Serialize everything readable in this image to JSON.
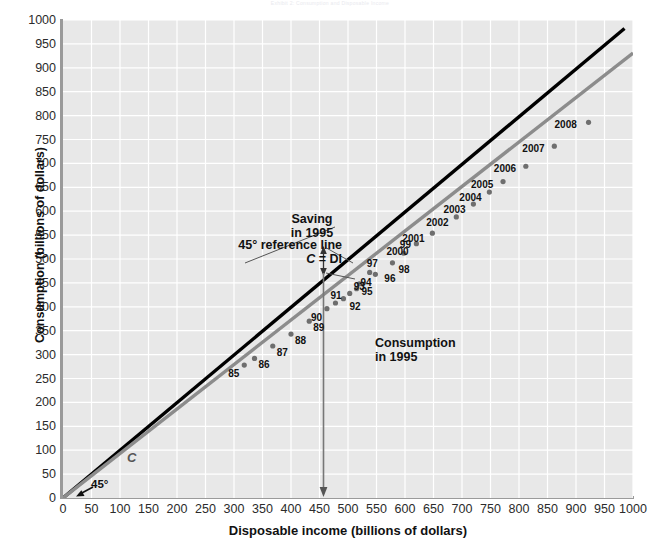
{
  "header": {
    "faint_text": "Exhibit 2: Consumption and Disposable Income"
  },
  "axes": {
    "x_title": "Disposable income (billions of dollars)",
    "y_title": "Consumption (billions of dollars)",
    "x_ticks": [
      0,
      50,
      100,
      150,
      200,
      250,
      300,
      350,
      400,
      450,
      500,
      550,
      600,
      650,
      700,
      750,
      800,
      850,
      900,
      950,
      1000
    ],
    "y_ticks": [
      0,
      50,
      100,
      150,
      200,
      250,
      300,
      350,
      400,
      450,
      500,
      550,
      600,
      650,
      700,
      750,
      800,
      850,
      900,
      950,
      1000
    ]
  },
  "annotations": {
    "ref_line_1": "45° reference line",
    "ref_line_2_c": "C",
    "ref_line_2_eq": "=",
    "ref_line_2_di": "DI",
    "saving_1": "Saving",
    "saving_2": "in 1995",
    "consumption_1": "Consumption",
    "consumption_2": "in 1995",
    "c_curve_label": "C",
    "angle_label": "45°"
  },
  "colors": {
    "plot_background": "#e8e8e8",
    "gridline": "#ffffff",
    "reference_line": "#000000",
    "consumption_line": "#8c8c8c",
    "data_point": "#6e6e6e",
    "axis": "#9a9a9a",
    "text": "#111111"
  },
  "chart_data": {
    "type": "scatter",
    "title": "Consumption and Disposable Income",
    "xlabel": "Disposable income (billions of dollars)",
    "ylabel": "Consumption (billions of dollars)",
    "xlim": [
      0,
      1000
    ],
    "ylim": [
      0,
      1000
    ],
    "grid": true,
    "legend": null,
    "point_labels": [
      "85",
      "86",
      "87",
      "88",
      "89",
      "90",
      "91",
      "92",
      "93",
      "94",
      "95",
      "96",
      "97",
      "98",
      "99",
      "2000",
      "2001",
      "2002",
      "2003",
      "2004",
      "2005",
      "2006",
      "2007",
      "2008"
    ],
    "x": [
      318,
      336,
      368,
      400,
      432,
      463,
      478,
      492,
      503,
      515,
      520,
      548,
      538,
      578,
      598,
      620,
      648,
      690,
      720,
      748,
      772,
      812,
      862,
      922
    ],
    "y": [
      278,
      292,
      318,
      343,
      370,
      396,
      408,
      417,
      428,
      438,
      448,
      468,
      472,
      492,
      512,
      532,
      554,
      588,
      615,
      640,
      662,
      694,
      736,
      786
    ],
    "series": [
      {
        "name": "45° reference line (C = DI)",
        "type": "line",
        "color": "#000000",
        "x": [
          0,
          1000
        ],
        "y": [
          0,
          1000
        ]
      },
      {
        "name": "Consumption function C",
        "type": "line",
        "color": "#8c8c8c",
        "x": [
          0,
          1000
        ],
        "y": [
          0,
          930
        ]
      }
    ],
    "callouts": [
      {
        "label": "Saving in 1995",
        "at_x": 520,
        "at_y": 485,
        "kind": "gap-arrow"
      },
      {
        "label": "Consumption in 1995",
        "at_x": 520,
        "at_y": 0,
        "kind": "drop-arrow"
      },
      {
        "label": "45° reference line C = DI",
        "at_x": 250,
        "at_y": 250,
        "kind": "leader"
      }
    ]
  }
}
